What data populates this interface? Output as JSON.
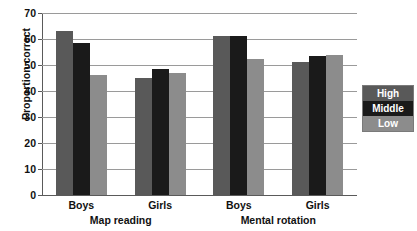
{
  "chart_data": {
    "type": "bar",
    "title": "",
    "xlabel": "",
    "ylabel": "Proportion correct",
    "ylim": [
      0,
      70
    ],
    "yticks": [
      0,
      10,
      20,
      30,
      40,
      50,
      60,
      70
    ],
    "grid": true,
    "legend_position": "right",
    "categories": [
      "Boys",
      "Girls",
      "Boys",
      "Girls"
    ],
    "panels": [
      {
        "label": "Map reading",
        "groups": [
          "Boys",
          "Girls"
        ]
      },
      {
        "label": "Mental rotation",
        "groups": [
          "Boys",
          "Girls"
        ]
      }
    ],
    "series": [
      {
        "name": "High",
        "color": "#595959",
        "values": [
          63,
          45,
          61,
          51
        ]
      },
      {
        "name": "Middle",
        "color": "#1a1a1a",
        "values": [
          58.5,
          48.5,
          61,
          53.5
        ]
      },
      {
        "name": "Low",
        "color": "#8c8c8c",
        "values": [
          46,
          47,
          52.5,
          54
        ]
      }
    ]
  },
  "legend": {
    "items": [
      {
        "label": "High"
      },
      {
        "label": "Middle"
      },
      {
        "label": "Low"
      }
    ]
  },
  "axis": {
    "ytitle": "Proportion correct",
    "ticks": [
      "70",
      "60",
      "50",
      "40",
      "30",
      "20",
      "10",
      "0"
    ]
  },
  "groups": [
    {
      "label": "Boys"
    },
    {
      "label": "Girls"
    },
    {
      "label": "Boys"
    },
    {
      "label": "Girls"
    }
  ],
  "panels": [
    {
      "label": "Map reading"
    },
    {
      "label": "Mental rotation"
    }
  ]
}
